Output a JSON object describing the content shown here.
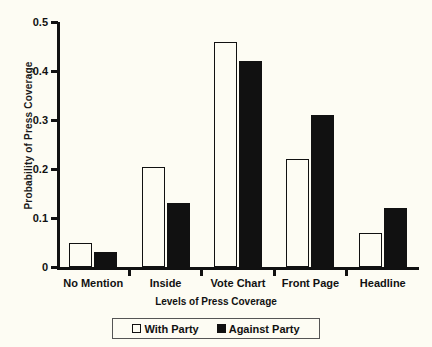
{
  "chart_data": {
    "type": "bar",
    "title": "",
    "xlabel": "Levels of Press Coverage",
    "ylabel": "Probability of  Press Coverage",
    "categories": [
      "No Mention",
      "Inside",
      "Vote Chart",
      "Front Page",
      "Headline"
    ],
    "series": [
      {
        "name": "With Party",
        "style": "open",
        "color": "#ffffff",
        "values": [
          0.05,
          0.205,
          0.46,
          0.22,
          0.07
        ]
      },
      {
        "name": "Against Party",
        "style": "filled",
        "color": "#111111",
        "values": [
          0.03,
          0.13,
          0.42,
          0.31,
          0.12
        ]
      }
    ],
    "ylim": [
      0,
      0.5
    ],
    "yticks": [
      0,
      0.1,
      0.2,
      0.3,
      0.4,
      0.5
    ],
    "ytick_labels": [
      "0",
      "0.1",
      "0.2",
      "0.3",
      "0.4",
      "0.5"
    ],
    "grid": false,
    "legend_position": "bottom-center",
    "legend": [
      "With Party",
      "Against Party"
    ]
  }
}
